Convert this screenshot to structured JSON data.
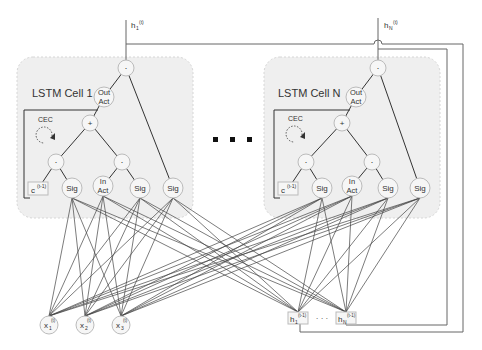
{
  "colors": {
    "line": "#333333",
    "cell_fill": "#efefef",
    "cell_border": "#cfcfcf",
    "node_fill": "#f6f6f6",
    "node_border": "#bbbbbb",
    "wire": "#555555"
  },
  "ellipsis": "· · ·",
  "cells": [
    {
      "id": "cell1",
      "label": "LSTM Cell 1",
      "output_label": "h",
      "output_sub": "1",
      "output_sup": "(t)",
      "cec_label": "CEC",
      "cprev_label": "c",
      "cprev_sup": "(t-1)",
      "nodes": {
        "out_mult": "·",
        "out_act_1": "Out",
        "out_act_2": "Act",
        "sum": "+",
        "forget_mult": "·",
        "input_mult": "·",
        "forget_gate": "Sig",
        "in_act_1": "In",
        "in_act_2": "Act",
        "input_gate": "Sig",
        "output_gate": "Sig"
      }
    },
    {
      "id": "cellN",
      "label": "LSTM Cell N",
      "output_label": "h",
      "output_sub": "N",
      "output_sup": "(t)",
      "cec_label": "CEC",
      "cprev_label": "c",
      "cprev_sup": "(t-1)",
      "nodes": {
        "out_mult": "·",
        "out_act_1": "Out",
        "out_act_2": "Act",
        "sum": "+",
        "forget_mult": "·",
        "input_mult": "·",
        "forget_gate": "Sig",
        "in_act_1": "In",
        "in_act_2": "Act",
        "input_gate": "Sig",
        "output_gate": "Sig"
      }
    }
  ],
  "inputs": [
    {
      "base": "x",
      "sub": "1",
      "sup": "(t)"
    },
    {
      "base": "x",
      "sub": "2",
      "sup": "(t)"
    },
    {
      "base": "x",
      "sub": "3",
      "sup": "(t)"
    }
  ],
  "recurrent_inputs": [
    {
      "base": "h",
      "sub": "1",
      "sup": "(t-1)"
    },
    {
      "base": "h",
      "sub": "N",
      "sup": "(t-1)"
    }
  ],
  "recurrent_ellipsis": "· · ·"
}
